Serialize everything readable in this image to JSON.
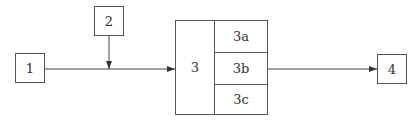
{
  "diagram": {
    "nodes": [
      {
        "id": "1",
        "label": "1"
      },
      {
        "id": "2",
        "label": "2"
      },
      {
        "id": "3",
        "label": "3",
        "parts": [
          "3a",
          "3b",
          "3c"
        ]
      },
      {
        "id": "4",
        "label": "4"
      }
    ],
    "edges": [
      {
        "from": "1",
        "to": "3"
      },
      {
        "from": "2",
        "to": "edge 1-3"
      },
      {
        "from": "3b",
        "to": "4"
      }
    ]
  }
}
